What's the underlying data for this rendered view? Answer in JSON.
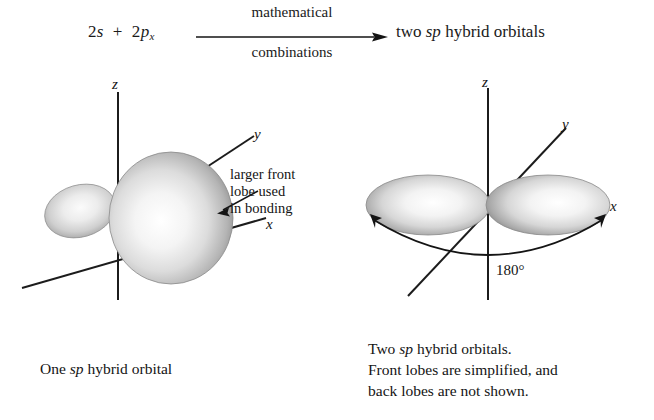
{
  "equation": {
    "left_prefix": "2",
    "left_s": "s",
    "plus": "+",
    "left_p_num": "2",
    "left_p": "p",
    "left_p_sub": "x",
    "above_arrow": "mathematical",
    "below_arrow": "combinations",
    "product_pre": "two ",
    "product_italic": "sp",
    "product_post": " hybrid orbitals"
  },
  "diagram_left": {
    "name": "one-sp-hybrid-orbital",
    "axes": {
      "z": "z",
      "y": "y",
      "x": "x"
    },
    "annotation_lines": [
      "larger front",
      "lobe used",
      "in bonding"
    ],
    "caption_pre": "One ",
    "caption_italic": "sp",
    "caption_post": " hybrid orbital"
  },
  "diagram_right": {
    "name": "two-sp-hybrid-orbitals",
    "axes": {
      "z": "z",
      "y": "y",
      "x": "x"
    },
    "angle": "180°",
    "caption_line1_pre": "Two ",
    "caption_line1_italic": "sp",
    "caption_line1_post": " hybrid orbitals.",
    "caption_line2": "Front lobes are simplified, and",
    "caption_line3": "back lobes are not shown."
  },
  "colors": {
    "ink": "#141414",
    "lobe_highlight": "#ffffff",
    "lobe_mid": "#d8d8d8",
    "lobe_edge": "#8f8f8f",
    "background": "#ffffff"
  }
}
